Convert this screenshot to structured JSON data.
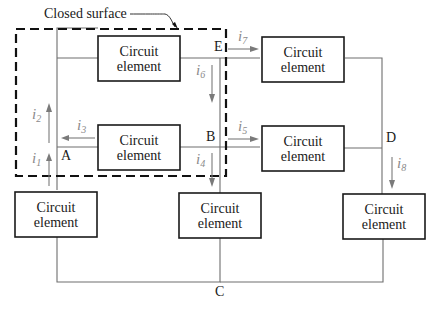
{
  "diagram": {
    "caption": "Closed surface",
    "element_label_line1": "Circuit",
    "element_label_line2": "element",
    "elements": [
      {
        "id": "top-left",
        "line1": "Circuit",
        "line2": "element"
      },
      {
        "id": "top-right",
        "line1": "Circuit",
        "line2": "element"
      },
      {
        "id": "mid-left",
        "line1": "Circuit",
        "line2": "element"
      },
      {
        "id": "mid-right",
        "line1": "Circuit",
        "line2": "element"
      },
      {
        "id": "bottom-left",
        "line1": "Circuit",
        "line2": "element"
      },
      {
        "id": "bottom-center",
        "line1": "Circuit",
        "line2": "element"
      },
      {
        "id": "bottom-right",
        "line1": "Circuit",
        "line2": "element"
      }
    ],
    "nodes": {
      "A": "A",
      "B": "B",
      "C": "C",
      "D": "D",
      "E": "E"
    },
    "currents": [
      {
        "name": "i",
        "sub": "1",
        "direction": "up"
      },
      {
        "name": "i",
        "sub": "2",
        "direction": "up"
      },
      {
        "name": "i",
        "sub": "3",
        "direction": "left"
      },
      {
        "name": "i",
        "sub": "4",
        "direction": "down"
      },
      {
        "name": "i",
        "sub": "5",
        "direction": "right"
      },
      {
        "name": "i",
        "sub": "6",
        "direction": "down"
      },
      {
        "name": "i",
        "sub": "7",
        "direction": "right"
      },
      {
        "name": "i",
        "sub": "8",
        "direction": "down"
      }
    ],
    "colors": {
      "wire": "#6e6e6e",
      "box": "#1a1a1a",
      "current_label": "#8a8a8a",
      "dashed_surface": "#111111"
    }
  }
}
